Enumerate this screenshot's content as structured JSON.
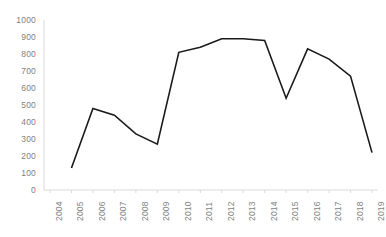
{
  "chart_data": {
    "type": "line",
    "title": "",
    "subtitle": "",
    "xlabel": "",
    "ylabel": "",
    "categories": [
      "2004",
      "2005",
      "2006",
      "2007",
      "2008",
      "2009",
      "2010",
      "2011",
      "2012",
      "2013",
      "2014",
      "2015",
      "2016",
      "2017",
      "2018",
      "2019"
    ],
    "x": [
      2004,
      2005,
      2006,
      2007,
      2008,
      2009,
      2010,
      2011,
      2012,
      2013,
      2014,
      2015,
      2016,
      2017,
      2018,
      2019
    ],
    "series": [
      {
        "name": "series-1",
        "color": "#1a1a1a",
        "values": [
          null,
          130,
          480,
          440,
          330,
          270,
          810,
          840,
          890,
          890,
          880,
          540,
          830,
          770,
          670,
          220
        ]
      }
    ],
    "ylim": [
      0,
      1000
    ],
    "yticks": [
      0,
      100,
      200,
      300,
      400,
      500,
      600,
      700,
      800,
      900,
      1000
    ],
    "ytick_labels": [
      "0",
      "100",
      "200",
      "300",
      "400",
      "500",
      "600",
      "700",
      "800",
      "900",
      "1000"
    ],
    "xtick_labels": [
      "2004",
      "2005",
      "2006",
      "2007",
      "2008",
      "2009",
      "2010",
      "2011",
      "2012",
      "2013",
      "2014",
      "2015",
      "2016",
      "2017",
      "2018",
      "2019"
    ],
    "grid": false,
    "legend": false,
    "legend_position": "none",
    "axis_color": "#d9d9d9",
    "tick_label_color": "#7f7f7f",
    "line_width": 1.6,
    "background": "#ffffff"
  }
}
